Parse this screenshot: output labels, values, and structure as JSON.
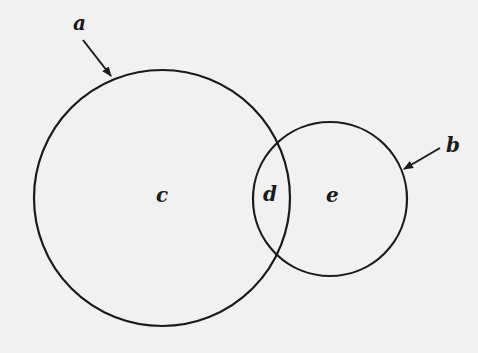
{
  "diagram": {
    "type": "venn",
    "colors": {
      "background": "#f1f1f1",
      "stroke": "#1a1a1a"
    },
    "circles": [
      {
        "id": "large-circle",
        "pointer_label": "a",
        "region_label": "c",
        "cx": 162,
        "cy": 198,
        "r": 128
      },
      {
        "id": "small-circle",
        "pointer_label": "b",
        "region_label": "e",
        "cx": 330,
        "cy": 199,
        "r": 77
      }
    ],
    "labels": {
      "a": "a",
      "b": "b",
      "c": "c",
      "d": "d",
      "e": "e"
    },
    "regions": [
      {
        "label": "c",
        "description": "large circle only"
      },
      {
        "label": "d",
        "description": "intersection"
      },
      {
        "label": "e",
        "description": "small circle only"
      }
    ]
  }
}
